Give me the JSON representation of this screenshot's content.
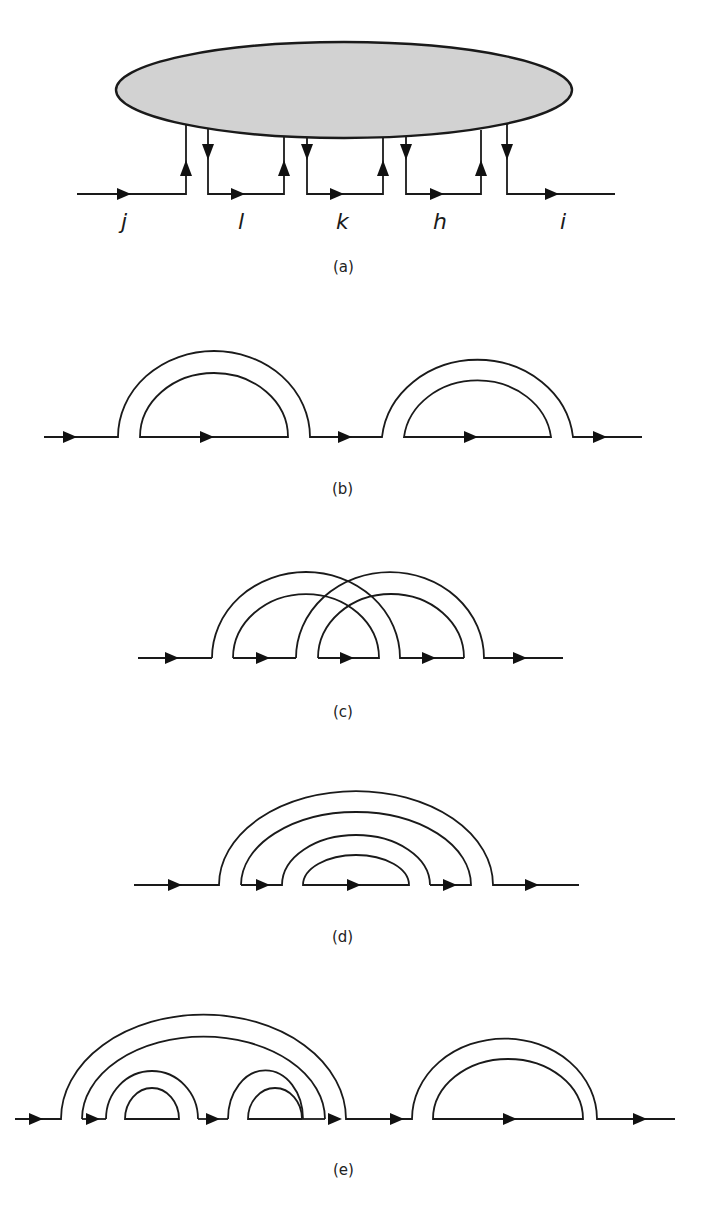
{
  "header": {
    "partial_text": "",
    "visible": true
  },
  "figure": {
    "panels": [
      {
        "id": "a",
        "caption": "(a)",
        "description": "Shaded blob with four propagator pairs connecting to a horizontal line"
      },
      {
        "id": "b",
        "caption": "(b)",
        "description": "Two sequential double-line arcs (rainbow insertions)"
      },
      {
        "id": "c",
        "caption": "(c)",
        "description": "Two crossing double-line arcs (non-planar)"
      },
      {
        "id": "d",
        "caption": "(d)",
        "description": "Two nested double-line arcs (planar rainbow)"
      },
      {
        "id": "e",
        "caption": "(e)",
        "description": "Large arc containing two small arcs, followed by a separate arc"
      }
    ],
    "panel_a_labels": [
      "j",
      "l",
      "k",
      "h",
      "i"
    ],
    "colors": {
      "line": "#1a1a1a",
      "blob_fill": "#d2d2d2",
      "background": "#ffffff"
    }
  }
}
